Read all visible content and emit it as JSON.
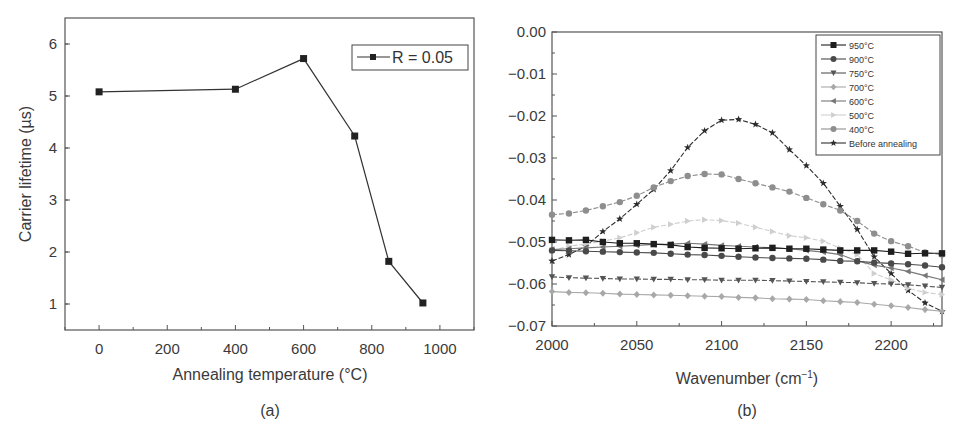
{
  "chart_data": [
    {
      "panel": "(a)",
      "type": "line",
      "title": "",
      "xlabel": "Annealing temperature (°C)",
      "ylabel": "Carrier lifetime (µs)",
      "xlim": [
        -100,
        1100
      ],
      "ylim": [
        0.5,
        6.5
      ],
      "xticks": [
        0,
        200,
        400,
        600,
        800,
        1000
      ],
      "yticks": [
        1,
        2,
        3,
        4,
        5,
        6
      ],
      "grid": false,
      "legend_position": "upper right",
      "series": [
        {
          "name": "R = 0.05",
          "marker": "square",
          "color": "#222222",
          "x": [
            0,
            400,
            600,
            750,
            850,
            950
          ],
          "values": [
            5.08,
            5.13,
            5.72,
            4.23,
            1.82,
            1.02
          ]
        }
      ]
    },
    {
      "panel": "(b)",
      "type": "line",
      "title": "",
      "xlabel": "Wavenumber (cm⁻¹)",
      "ylabel": "",
      "xlim": [
        2000,
        2230
      ],
      "ylim": [
        -0.07,
        0.0
      ],
      "xticks": [
        2000,
        2050,
        2100,
        2150,
        2200
      ],
      "yticks": [
        "0.00",
        "−0.01",
        "−0.02",
        "−0.03",
        "−0.04",
        "−0.05",
        "−0.06",
        "−0.07"
      ],
      "ytick_values": [
        0.0,
        -0.01,
        -0.02,
        -0.03,
        -0.04,
        -0.05,
        -0.06,
        -0.07
      ],
      "grid": false,
      "legend_position": "upper right",
      "x": [
        2000,
        2010,
        2020,
        2030,
        2040,
        2050,
        2060,
        2070,
        2080,
        2090,
        2100,
        2110,
        2120,
        2130,
        2140,
        2150,
        2160,
        2170,
        2180,
        2190,
        2200,
        2210,
        2220,
        2230
      ],
      "series": [
        {
          "name": "950°C",
          "marker": "square",
          "color": "#1e1e1e",
          "dash": false,
          "values": [
            -0.0495,
            -0.0496,
            -0.0495,
            -0.05,
            -0.0503,
            -0.0503,
            -0.0505,
            -0.0507,
            -0.0512,
            -0.0514,
            -0.0515,
            -0.0516,
            -0.0515,
            -0.0514,
            -0.0516,
            -0.0516,
            -0.0518,
            -0.052,
            -0.052,
            -0.052,
            -0.0523,
            -0.0528,
            -0.0527,
            -0.0527
          ]
        },
        {
          "name": "900°C",
          "marker": "circle",
          "color": "#4a4a4a",
          "dash": false,
          "values": [
            -0.052,
            -0.0521,
            -0.0522,
            -0.0523,
            -0.0524,
            -0.0525,
            -0.0526,
            -0.0528,
            -0.053,
            -0.0531,
            -0.0533,
            -0.0535,
            -0.0537,
            -0.0538,
            -0.0539,
            -0.054,
            -0.0542,
            -0.0545,
            -0.0546,
            -0.0549,
            -0.0551,
            -0.0553,
            -0.0556,
            -0.056
          ]
        },
        {
          "name": "750°C",
          "marker": "triangle-down",
          "color": "#555555",
          "dash": true,
          "values": [
            -0.0583,
            -0.0585,
            -0.0586,
            -0.0587,
            -0.0588,
            -0.0588,
            -0.0589,
            -0.0589,
            -0.059,
            -0.059,
            -0.0591,
            -0.0591,
            -0.0591,
            -0.0592,
            -0.0593,
            -0.0594,
            -0.0595,
            -0.0596,
            -0.0597,
            -0.0599,
            -0.06,
            -0.0602,
            -0.0605,
            -0.0608
          ]
        },
        {
          "name": "700°C",
          "marker": "diamond",
          "color": "#a8a8a8",
          "dash": false,
          "values": [
            -0.0618,
            -0.062,
            -0.0621,
            -0.0622,
            -0.0624,
            -0.0625,
            -0.0626,
            -0.0627,
            -0.0628,
            -0.0629,
            -0.063,
            -0.0632,
            -0.0633,
            -0.0635,
            -0.0636,
            -0.0637,
            -0.064,
            -0.0642,
            -0.0644,
            -0.0648,
            -0.0652,
            -0.0656,
            -0.0661,
            -0.0665
          ]
        },
        {
          "name": "600°C",
          "marker": "triangle-left",
          "color": "#777777",
          "dash": false,
          "values": [
            -0.0518,
            -0.0516,
            -0.0514,
            -0.0512,
            -0.051,
            -0.0508,
            -0.0506,
            -0.0505,
            -0.0503,
            -0.0505,
            -0.0508,
            -0.051,
            -0.0512,
            -0.0514,
            -0.0516,
            -0.052,
            -0.0524,
            -0.053,
            -0.0545,
            -0.0555,
            -0.0562,
            -0.057,
            -0.058,
            -0.059
          ]
        },
        {
          "name": "500°C",
          "marker": "triangle-right",
          "color": "#cfcfcf",
          "dash": true,
          "values": [
            -0.052,
            -0.051,
            -0.0505,
            -0.0498,
            -0.049,
            -0.0478,
            -0.0465,
            -0.0458,
            -0.045,
            -0.0447,
            -0.0449,
            -0.0455,
            -0.0465,
            -0.0475,
            -0.0485,
            -0.049,
            -0.0498,
            -0.0515,
            -0.053,
            -0.0575,
            -0.059,
            -0.061,
            -0.062,
            -0.0625
          ]
        },
        {
          "name": "400°C",
          "marker": "circle",
          "color": "#8e8e8e",
          "dash": true,
          "values": [
            -0.0435,
            -0.0432,
            -0.0425,
            -0.0415,
            -0.0405,
            -0.039,
            -0.037,
            -0.0355,
            -0.0343,
            -0.0338,
            -0.0339,
            -0.035,
            -0.036,
            -0.037,
            -0.038,
            -0.0395,
            -0.041,
            -0.0425,
            -0.045,
            -0.048,
            -0.0498,
            -0.051,
            -0.0525,
            -0.053
          ]
        },
        {
          "name": "Before annealing",
          "marker": "star",
          "color": "#2e2e2e",
          "dash": true,
          "values": [
            -0.0545,
            -0.053,
            -0.051,
            -0.0475,
            -0.0445,
            -0.041,
            -0.0375,
            -0.033,
            -0.0275,
            -0.0235,
            -0.021,
            -0.0208,
            -0.022,
            -0.024,
            -0.028,
            -0.0318,
            -0.036,
            -0.0415,
            -0.047,
            -0.0535,
            -0.0575,
            -0.0615,
            -0.0645,
            -0.0665
          ]
        }
      ]
    }
  ],
  "labels": {
    "panel_a": "(a)",
    "panel_b": "(b)",
    "a_xlabel": "Annealing temperature (°C)",
    "a_ylabel": "Carrier lifetime (µs)",
    "a_legend": "R = 0.05",
    "b_xlabel_main": "Wavenumber (cm",
    "b_xlabel_sup": "−1",
    "b_xlabel_close": ")"
  }
}
